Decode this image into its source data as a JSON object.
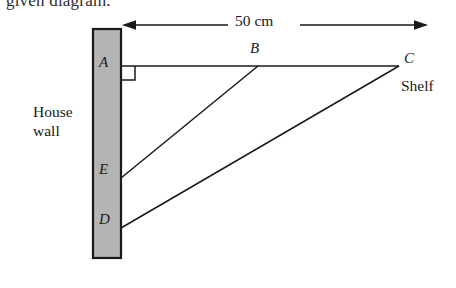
{
  "figure": {
    "type": "geometry-diagram",
    "cut_off_caption": "given diagram.",
    "dimension": {
      "label": "50 cm",
      "arrow_style": "double-headed",
      "from_x": 122,
      "to_x": 428,
      "y": 25
    },
    "wall": {
      "label_line1": "House",
      "label_line2": "wall",
      "fill_color": "#b4b4b4",
      "stroke_color": "#1a1a1a",
      "x": 93,
      "y": 29,
      "width": 28,
      "height": 229
    },
    "shelf": {
      "label": "Shelf",
      "line_from": "A",
      "line_to": "C"
    },
    "right_angle": {
      "at_point": "A",
      "size": 14
    },
    "points": [
      {
        "id": "A",
        "label": "A",
        "x": 121,
        "y": 66,
        "role": "shelf-wall-joint"
      },
      {
        "id": "B",
        "label": "B",
        "x": 258,
        "y": 66,
        "role": "brace-top-upper"
      },
      {
        "id": "C",
        "label": "C",
        "x": 399,
        "y": 66,
        "role": "shelf-outer-end"
      },
      {
        "id": "D",
        "label": "D",
        "x": 121,
        "y": 228,
        "role": "brace-lower-wall"
      },
      {
        "id": "E",
        "label": "E",
        "x": 121,
        "y": 178,
        "role": "brace-upper-wall"
      }
    ],
    "segments": [
      {
        "from": "A",
        "to": "C",
        "name": "shelf-line"
      },
      {
        "from": "E",
        "to": "B",
        "name": "upper-brace-line"
      },
      {
        "from": "D",
        "to": "C",
        "name": "lower-brace-line"
      }
    ]
  }
}
